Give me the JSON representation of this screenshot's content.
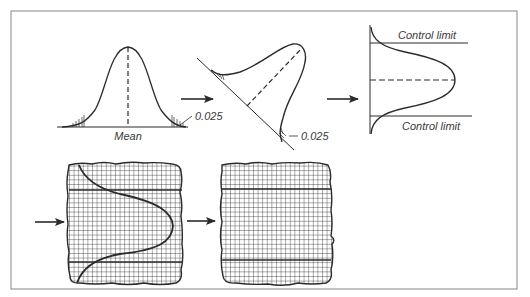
{
  "diagram": {
    "labels": {
      "mean": "Mean",
      "tail_left_top": "0.025",
      "tail_right_bottom": "0.025",
      "upper_control": "Control limit",
      "lower_control": "Control limit"
    },
    "colors": {
      "line": "#2b2b2b",
      "frame": "#9a9a9a",
      "background": "#ffffff"
    },
    "panels": [
      {
        "id": "normal-curve",
        "caption_ref": "labels.mean"
      },
      {
        "id": "skewed-curve",
        "caption_ref": "labels.tail_right_bottom"
      },
      {
        "id": "control-chart-curve",
        "caption_ref": "labels.upper_control"
      },
      {
        "id": "grid-with-curve"
      },
      {
        "id": "grid-with-limits"
      }
    ],
    "arrows": [
      {
        "id": "arrow-1",
        "from": "normal-curve",
        "to": "skewed-curve"
      },
      {
        "id": "arrow-2",
        "from": "skewed-curve",
        "to": "control-chart-curve"
      },
      {
        "id": "arrow-3",
        "to": "grid-with-curve"
      },
      {
        "id": "arrow-4",
        "from": "grid-with-curve",
        "to": "grid-with-limits"
      }
    ]
  }
}
